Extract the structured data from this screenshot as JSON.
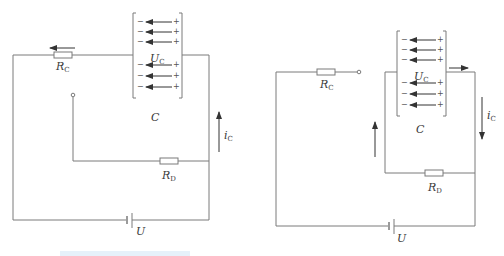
{
  "colors": {
    "wire": "#7a7a7a",
    "arrow": "#333333",
    "text": "#3a3a3a",
    "highlight_bar": "#e6f1fa"
  },
  "diagrams": [
    {
      "id": "charging",
      "labels": {
        "resistor_c": {
          "main": "R",
          "sub": "C"
        },
        "resistor_d": {
          "main": "R",
          "sub": "D"
        },
        "capacitor_voltage": {
          "main": "U",
          "sub": "C"
        },
        "capacitor": "C",
        "current": {
          "main": "i",
          "sub": "C"
        },
        "source": "U"
      },
      "plate_signs": {
        "left": "−",
        "right": "+"
      },
      "field_arrow_rows": 6,
      "current_direction": "up",
      "rc_arrow_direction": "left"
    },
    {
      "id": "discharging",
      "labels": {
        "resistor_c": {
          "main": "R",
          "sub": "C"
        },
        "resistor_d": {
          "main": "R",
          "sub": "D"
        },
        "capacitor_voltage": {
          "main": "U",
          "sub": "C"
        },
        "capacitor": "C",
        "current": {
          "main": "i",
          "sub": "C"
        },
        "source": "U"
      },
      "plate_signs": {
        "left": "−",
        "right": "+"
      },
      "field_arrow_rows": 6,
      "current_direction": "down",
      "loop_arrow_direction": "up",
      "top_arrow_direction": "right"
    }
  ]
}
